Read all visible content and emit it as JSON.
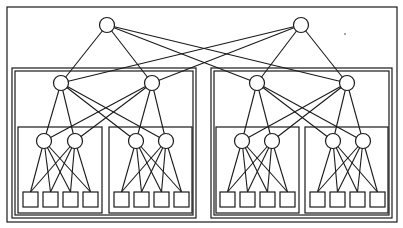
{
  "diagram": {
    "type": "hierarchical-network",
    "colors": {
      "stroke": "#1a1a1a",
      "fill": "#ffffff",
      "background": "#ffffff"
    },
    "outer_frame": {
      "x": 7,
      "y": 7,
      "w": 390,
      "h": 215
    },
    "group_frames": [
      {
        "id": "G-L",
        "x": 12,
        "y": 68,
        "w": 184,
        "h": 150,
        "double": true
      },
      {
        "id": "G-R",
        "x": 211,
        "y": 68,
        "w": 181,
        "h": 150,
        "double": true
      },
      {
        "id": "G-LL",
        "x": 18,
        "y": 127,
        "w": 84,
        "h": 86,
        "double": false
      },
      {
        "id": "G-LR",
        "x": 109,
        "y": 127,
        "w": 83,
        "h": 86,
        "double": false
      },
      {
        "id": "G-RL",
        "x": 216,
        "y": 127,
        "w": 83,
        "h": 86,
        "double": false
      },
      {
        "id": "G-RR",
        "x": 305,
        "y": 127,
        "w": 83,
        "h": 86,
        "double": false
      }
    ],
    "nodes": [
      {
        "id": "R1",
        "level": 1,
        "cx": 107,
        "cy": 25,
        "r": 7.5
      },
      {
        "id": "R2",
        "level": 1,
        "cx": 301,
        "cy": 25,
        "r": 7.5
      },
      {
        "id": "A1",
        "level": 2,
        "cx": 61,
        "cy": 83,
        "r": 7.5
      },
      {
        "id": "A2",
        "level": 2,
        "cx": 152,
        "cy": 83,
        "r": 7.5
      },
      {
        "id": "A3",
        "level": 2,
        "cx": 257,
        "cy": 83,
        "r": 7.5
      },
      {
        "id": "A4",
        "level": 2,
        "cx": 347,
        "cy": 83,
        "r": 7.5
      },
      {
        "id": "B1",
        "level": 3,
        "cx": 44,
        "cy": 141,
        "r": 7.5
      },
      {
        "id": "B2",
        "level": 3,
        "cx": 75,
        "cy": 141,
        "r": 7.5
      },
      {
        "id": "B3",
        "level": 3,
        "cx": 136,
        "cy": 141,
        "r": 7.5
      },
      {
        "id": "B4",
        "level": 3,
        "cx": 166,
        "cy": 141,
        "r": 7.5
      },
      {
        "id": "B5",
        "level": 3,
        "cx": 242,
        "cy": 141,
        "r": 7.5
      },
      {
        "id": "B6",
        "level": 3,
        "cx": 272,
        "cy": 141,
        "r": 7.5
      },
      {
        "id": "B7",
        "level": 3,
        "cx": 333,
        "cy": 141,
        "r": 7.5
      },
      {
        "id": "B8",
        "level": 3,
        "cx": 363,
        "cy": 141,
        "r": 7.5
      }
    ],
    "leaves": [
      {
        "id": "L1",
        "x": 23,
        "y": 192,
        "w": 15,
        "h": 15
      },
      {
        "id": "L2",
        "x": 43,
        "y": 192,
        "w": 15,
        "h": 15
      },
      {
        "id": "L3",
        "x": 63,
        "y": 192,
        "w": 15,
        "h": 15
      },
      {
        "id": "L4",
        "x": 83,
        "y": 192,
        "w": 15,
        "h": 15
      },
      {
        "id": "L5",
        "x": 114,
        "y": 192,
        "w": 15,
        "h": 15
      },
      {
        "id": "L6",
        "x": 134,
        "y": 192,
        "w": 15,
        "h": 15
      },
      {
        "id": "L7",
        "x": 154,
        "y": 192,
        "w": 15,
        "h": 15
      },
      {
        "id": "L8",
        "x": 174,
        "y": 192,
        "w": 15,
        "h": 15
      },
      {
        "id": "L9",
        "x": 220,
        "y": 192,
        "w": 15,
        "h": 15
      },
      {
        "id": "L10",
        "x": 240,
        "y": 192,
        "w": 15,
        "h": 15
      },
      {
        "id": "L11",
        "x": 260,
        "y": 192,
        "w": 15,
        "h": 15
      },
      {
        "id": "L12",
        "x": 280,
        "y": 192,
        "w": 15,
        "h": 15
      },
      {
        "id": "L13",
        "x": 310,
        "y": 192,
        "w": 15,
        "h": 15
      },
      {
        "id": "L14",
        "x": 330,
        "y": 192,
        "w": 15,
        "h": 15
      },
      {
        "id": "L15",
        "x": 350,
        "y": 192,
        "w": 15,
        "h": 15
      },
      {
        "id": "L16",
        "x": 370,
        "y": 192,
        "w": 15,
        "h": 15
      }
    ],
    "edges": [
      [
        "R1",
        "A1"
      ],
      [
        "R1",
        "A2"
      ],
      [
        "R1",
        "A3"
      ],
      [
        "R1",
        "A4"
      ],
      [
        "R2",
        "A1"
      ],
      [
        "R2",
        "A2"
      ],
      [
        "R2",
        "A3"
      ],
      [
        "R2",
        "A4"
      ],
      [
        "A1",
        "B1"
      ],
      [
        "A1",
        "B2"
      ],
      [
        "A1",
        "B3"
      ],
      [
        "A1",
        "B4"
      ],
      [
        "A2",
        "B1"
      ],
      [
        "A2",
        "B2"
      ],
      [
        "A2",
        "B3"
      ],
      [
        "A2",
        "B4"
      ],
      [
        "A3",
        "B5"
      ],
      [
        "A3",
        "B6"
      ],
      [
        "A3",
        "B7"
      ],
      [
        "A3",
        "B8"
      ],
      [
        "A4",
        "B5"
      ],
      [
        "A4",
        "B6"
      ],
      [
        "A4",
        "B7"
      ],
      [
        "A4",
        "B8"
      ],
      [
        "B1",
        "L1"
      ],
      [
        "B1",
        "L2"
      ],
      [
        "B1",
        "L3"
      ],
      [
        "B1",
        "L4"
      ],
      [
        "B2",
        "L1"
      ],
      [
        "B2",
        "L2"
      ],
      [
        "B2",
        "L3"
      ],
      [
        "B2",
        "L4"
      ],
      [
        "B3",
        "L5"
      ],
      [
        "B3",
        "L6"
      ],
      [
        "B3",
        "L7"
      ],
      [
        "B3",
        "L8"
      ],
      [
        "B4",
        "L5"
      ],
      [
        "B4",
        "L6"
      ],
      [
        "B4",
        "L7"
      ],
      [
        "B4",
        "L8"
      ],
      [
        "B5",
        "L9"
      ],
      [
        "B5",
        "L10"
      ],
      [
        "B5",
        "L11"
      ],
      [
        "B5",
        "L12"
      ],
      [
        "B6",
        "L9"
      ],
      [
        "B6",
        "L10"
      ],
      [
        "B6",
        "L11"
      ],
      [
        "B6",
        "L12"
      ],
      [
        "B7",
        "L13"
      ],
      [
        "B7",
        "L14"
      ],
      [
        "B7",
        "L15"
      ],
      [
        "B7",
        "L16"
      ],
      [
        "B8",
        "L13"
      ],
      [
        "B8",
        "L14"
      ],
      [
        "B8",
        "L15"
      ],
      [
        "B8",
        "L16"
      ]
    ]
  }
}
